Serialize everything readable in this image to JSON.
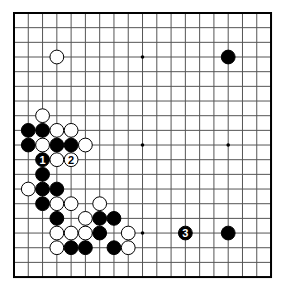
{
  "board": {
    "size": 19,
    "origin": {
      "x": 14,
      "y": 13
    },
    "step": {
      "x": 14.28,
      "y": 14.67
    },
    "line_color": "#555555",
    "border_color": "#000000",
    "star_points": [
      [
        3,
        3
      ],
      [
        9,
        3
      ],
      [
        15,
        3
      ],
      [
        3,
        9
      ],
      [
        9,
        9
      ],
      [
        15,
        9
      ],
      [
        3,
        15
      ],
      [
        9,
        15
      ],
      [
        15,
        15
      ]
    ],
    "stones": [
      {
        "color": "white",
        "col": 3,
        "row": 3
      },
      {
        "color": "black",
        "col": 15,
        "row": 3
      },
      {
        "color": "white",
        "col": 2,
        "row": 7
      },
      {
        "color": "black",
        "col": 1,
        "row": 8
      },
      {
        "color": "black",
        "col": 2,
        "row": 8
      },
      {
        "color": "white",
        "col": 3,
        "row": 8
      },
      {
        "color": "white",
        "col": 4,
        "row": 8
      },
      {
        "color": "black",
        "col": 1,
        "row": 9
      },
      {
        "color": "white",
        "col": 2,
        "row": 9
      },
      {
        "color": "black",
        "col": 3,
        "row": 9
      },
      {
        "color": "black",
        "col": 4,
        "row": 9
      },
      {
        "color": "white",
        "col": 5,
        "row": 9
      },
      {
        "color": "black",
        "col": 2,
        "row": 10,
        "label": "1"
      },
      {
        "color": "white",
        "col": 3,
        "row": 10
      },
      {
        "color": "white",
        "col": 4,
        "row": 10,
        "label": "2"
      },
      {
        "color": "black",
        "col": 2,
        "row": 11
      },
      {
        "color": "white",
        "col": 1,
        "row": 12
      },
      {
        "color": "black",
        "col": 2,
        "row": 12
      },
      {
        "color": "black",
        "col": 3,
        "row": 12
      },
      {
        "color": "black",
        "col": 2,
        "row": 13
      },
      {
        "color": "white",
        "col": 3,
        "row": 13
      },
      {
        "color": "white",
        "col": 4,
        "row": 13
      },
      {
        "color": "white",
        "col": 6,
        "row": 13
      },
      {
        "color": "black",
        "col": 3,
        "row": 14
      },
      {
        "color": "white",
        "col": 5,
        "row": 14
      },
      {
        "color": "black",
        "col": 6,
        "row": 14
      },
      {
        "color": "black",
        "col": 7,
        "row": 14
      },
      {
        "color": "white",
        "col": 3,
        "row": 15
      },
      {
        "color": "white",
        "col": 4,
        "row": 15
      },
      {
        "color": "white",
        "col": 5,
        "row": 15
      },
      {
        "color": "black",
        "col": 6,
        "row": 15
      },
      {
        "color": "white",
        "col": 8,
        "row": 15
      },
      {
        "color": "black",
        "col": 12,
        "row": 15,
        "label": "3"
      },
      {
        "color": "black",
        "col": 15,
        "row": 15
      },
      {
        "color": "white",
        "col": 3,
        "row": 16
      },
      {
        "color": "black",
        "col": 4,
        "row": 16
      },
      {
        "color": "black",
        "col": 5,
        "row": 16
      },
      {
        "color": "black",
        "col": 7,
        "row": 16
      },
      {
        "color": "white",
        "col": 8,
        "row": 16
      }
    ]
  },
  "move_labels": [
    "1",
    "2",
    "3"
  ]
}
